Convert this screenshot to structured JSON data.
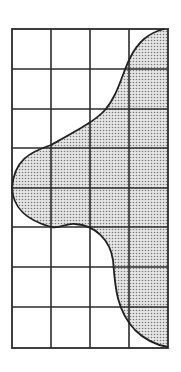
{
  "figure": {
    "type": "grid-with-shaded-region",
    "grid": {
      "columns": 4,
      "rows": 8,
      "left": 12,
      "top": 29,
      "cell_width": 39,
      "cell_height": 39.875
    },
    "colors": {
      "background": "#ffffff",
      "grid_line": "#2b2b2b",
      "shade_fill": "#d9d9d9",
      "shade_dot": "#7a7a7a",
      "curve": "#222222"
    }
  }
}
